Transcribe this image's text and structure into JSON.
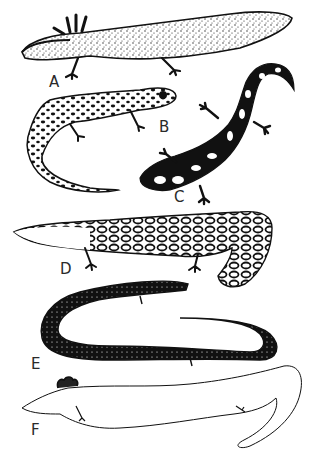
{
  "figure": {
    "panels": [
      {
        "id": "A",
        "label": "A",
        "form": "aquatic larval form with external gills, speckled body and fin-like tail"
      },
      {
        "id": "B",
        "label": "B",
        "form": "terrestrial salamander with mottled pattern and long tail"
      },
      {
        "id": "C",
        "label": "C",
        "form": "dark salamander with pale spots"
      },
      {
        "id": "D",
        "label": "D",
        "form": "flattened aquatic salamander with reticulated pattern and paddle tail"
      },
      {
        "id": "E",
        "label": "E",
        "form": "elongate dark eel-like form with tiny limbs"
      },
      {
        "id": "F",
        "label": "F",
        "form": "pale elongate form with external gills and tiny limbs"
      }
    ]
  },
  "colors": {
    "ink": "#111111",
    "paper": "#ffffff",
    "label": "#2a2a2a"
  }
}
